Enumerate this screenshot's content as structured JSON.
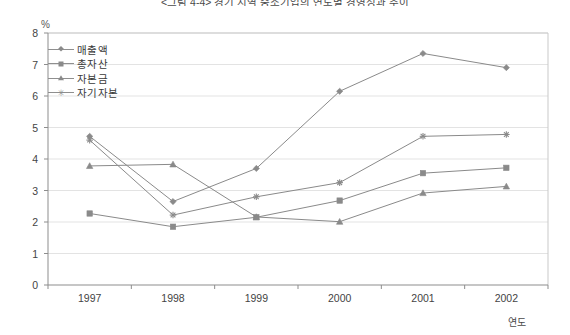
{
  "chart_data": {
    "type": "line",
    "title": "<그림 4-4> 경기 지역 중소기업의 연도별 경영성과 추이",
    "unit_label": "%",
    "xlabel": "연도",
    "ylabel": "",
    "categories": [
      "1997",
      "1998",
      "1999",
      "2000",
      "2001",
      "2002"
    ],
    "ylim": [
      0,
      8
    ],
    "yticks": [
      0,
      1,
      2,
      3,
      4,
      5,
      6,
      7,
      8
    ],
    "grid": true,
    "legend_position": "top-left-inside",
    "series": [
      {
        "name": "매출액",
        "marker": "diamond",
        "color": "#8a8a8a",
        "values": [
          4.72,
          2.65,
          3.7,
          6.15,
          7.35,
          6.9
        ]
      },
      {
        "name": "총자산",
        "marker": "square",
        "color": "#8a8a8a",
        "values": [
          2.27,
          1.85,
          2.15,
          2.68,
          3.55,
          3.72
        ]
      },
      {
        "name": "자본금",
        "marker": "triangle",
        "color": "#8a8a8a",
        "values": [
          3.78,
          3.83,
          2.16,
          2.01,
          2.92,
          3.13
        ]
      },
      {
        "name": "자기자본",
        "marker": "star",
        "color": "#8a8a8a",
        "values": [
          4.6,
          2.22,
          2.8,
          3.25,
          4.72,
          4.78
        ]
      }
    ]
  },
  "axis": {
    "ytick_labels": [
      "8",
      "7",
      "6",
      "5",
      "4",
      "3",
      "2",
      "1",
      "0"
    ],
    "xtick_labels": [
      "1997",
      "1998",
      "1999",
      "2000",
      "2001",
      "2002"
    ]
  }
}
